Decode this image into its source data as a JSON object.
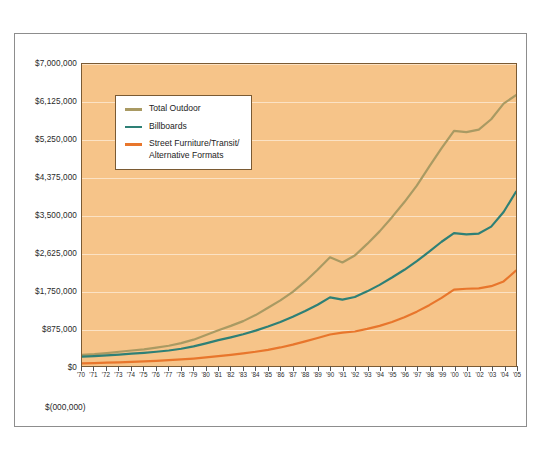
{
  "caption": "$(000,000)",
  "colors": {
    "plot_background": "#f6c489",
    "gridline": "#fbe2c4",
    "total_outdoor": "#a99a63",
    "billboards": "#2e8076",
    "street_furniture": "#e8762c",
    "frame": "#8d8d8d",
    "plot_border": "#7a5a33"
  },
  "legend": {
    "items": [
      {
        "label": "Total Outdoor",
        "color": "#a99a63"
      },
      {
        "label": "Billboards",
        "color": "#2e8076"
      },
      {
        "label": "Street Furniture/Transit/\nAlternative Formats",
        "color": "#e8762c"
      }
    ]
  },
  "chart_data": {
    "type": "line",
    "title": "",
    "xlabel": "",
    "ylabel": "$(000,000)",
    "ylim": [
      0,
      7000000
    ],
    "grid": true,
    "legend_position": "top-left",
    "ytick_labels": [
      "$0",
      "$875,000",
      "$1,750,000",
      "$2,625,000",
      "$3,500,000",
      "$4,375,000",
      "$5,250,000",
      "$6,125,000",
      "$7,000,000"
    ],
    "ytick_values": [
      0,
      875000,
      1750000,
      2625000,
      3500000,
      4375000,
      5250000,
      6125000,
      7000000
    ],
    "categories": [
      "'70",
      "'71",
      "'72",
      "'73",
      "'74",
      "'75",
      "'76",
      "'77",
      "'78",
      "'79",
      "'80",
      "'81",
      "'82",
      "'83",
      "'84",
      "'85",
      "'86",
      "'87",
      "'88",
      "'89",
      "'90",
      "'91",
      "'92",
      "'93",
      "'94",
      "'95",
      "'96",
      "'97",
      "'98",
      "'99",
      "'00",
      "'01",
      "'02",
      "'03",
      "'04",
      "'05"
    ],
    "series": [
      {
        "name": "Total Outdoor",
        "color": "#a99a63",
        "values": [
          260000,
          275000,
          300000,
          330000,
          360000,
          385000,
          425000,
          470000,
          530000,
          610000,
          720000,
          830000,
          930000,
          1040000,
          1180000,
          1350000,
          1520000,
          1720000,
          1960000,
          2230000,
          2520000,
          2400000,
          2560000,
          2830000,
          3120000,
          3450000,
          3800000,
          4180000,
          4620000,
          5050000,
          5450000,
          5420000,
          5480000,
          5720000,
          6080000,
          6280000
        ]
      },
      {
        "name": "Billboards",
        "color": "#2e8076",
        "values": [
          215000,
          228000,
          245000,
          265000,
          285000,
          305000,
          330000,
          360000,
          400000,
          455000,
          525000,
          600000,
          665000,
          735000,
          820000,
          915000,
          1020000,
          1140000,
          1275000,
          1420000,
          1590000,
          1540000,
          1600000,
          1730000,
          1880000,
          2050000,
          2230000,
          2430000,
          2650000,
          2880000,
          3080000,
          3050000,
          3070000,
          3230000,
          3570000,
          4040000
        ]
      },
      {
        "name": "Street Furniture/Transit/Alternative Formats",
        "color": "#e8762c",
        "values": [
          62000,
          68000,
          76000,
          85000,
          95000,
          107000,
          120000,
          135000,
          152000,
          172000,
          198000,
          228000,
          258000,
          292000,
          330000,
          375000,
          430000,
          495000,
          570000,
          650000,
          730000,
          775000,
          800000,
          860000,
          930000,
          1020000,
          1130000,
          1260000,
          1410000,
          1580000,
          1770000,
          1790000,
          1800000,
          1850000,
          1960000,
          2210000
        ]
      }
    ]
  }
}
